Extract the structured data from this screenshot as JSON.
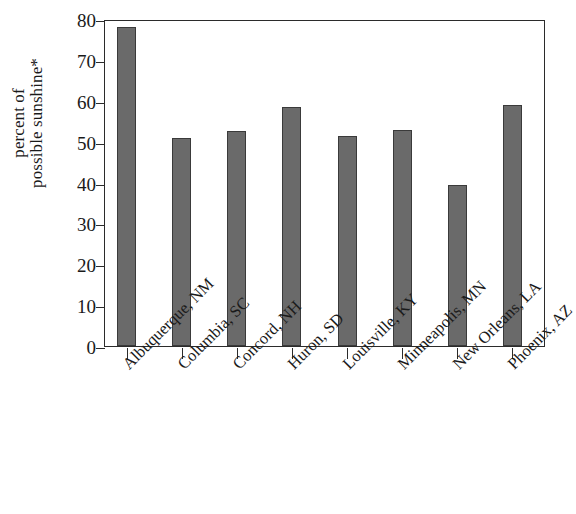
{
  "chart_data": {
    "type": "bar",
    "title": "",
    "subtitle": "",
    "xlabel": "",
    "ylabel": "percent of possible sunshine*",
    "ylabel_lines": [
      "percent of",
      "possible sunshine*"
    ],
    "categories": [
      "Albuquerque, NM",
      "Columbia, SC",
      "Concord, NH",
      "Huron, SD",
      "Louisville, KY",
      "Minneapolis, MN",
      "New Orleans, LA",
      "Phoenix, AZ"
    ],
    "values": [
      78,
      51,
      52.5,
      58.5,
      51.5,
      52.8,
      39.5,
      59
    ],
    "ylim": [
      0,
      80
    ],
    "ytick_labels": [
      "0",
      "10",
      "20",
      "30",
      "40",
      "50",
      "60",
      "70",
      "80"
    ],
    "ytick_values": [
      0,
      10,
      20,
      30,
      40,
      50,
      60,
      70,
      80
    ],
    "grid": false,
    "legend": "none",
    "bar_color": "#6a6a6a",
    "bar_edge_color": "#3a3a3a",
    "axis_color": "#2b2b2b",
    "background_color": "#ffffff"
  }
}
